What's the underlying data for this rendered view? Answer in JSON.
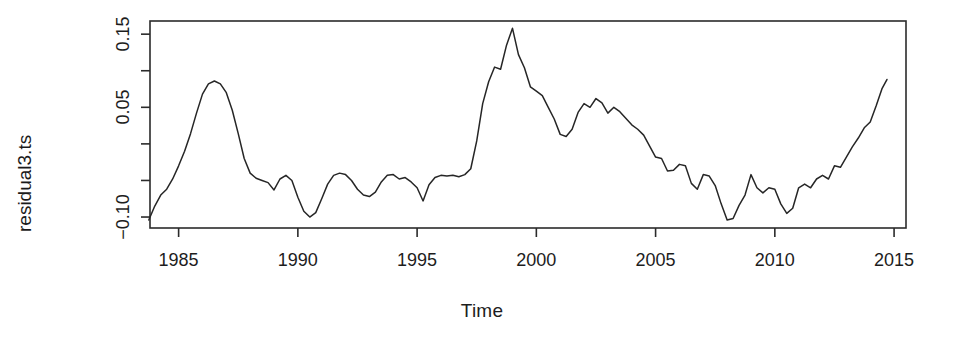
{
  "chart_data": {
    "type": "line",
    "title": "",
    "subtitle": "",
    "xlabel": "Time",
    "ylabel": "residual3.ts",
    "xlim": [
      1983.8,
      2015.5
    ],
    "ylim": [
      -0.115,
      0.168
    ],
    "xticks": [
      1985,
      1990,
      1995,
      2000,
      2005,
      2010,
      2015
    ],
    "xtick_labels": [
      "1985",
      "1990",
      "1995",
      "2000",
      "2005",
      "2010",
      "2015"
    ],
    "yticks": [
      -0.1,
      -0.05,
      0.0,
      0.05,
      0.1,
      0.15
    ],
    "ytick_labels": [
      "-0.10",
      "",
      "",
      "0.05",
      "",
      "0.15"
    ],
    "ytick_labels_shown": [
      {
        "value": 0.15,
        "label": "0.15"
      },
      {
        "value": 0.05,
        "label": "0.05"
      },
      {
        "value": -0.1,
        "label": "-0.10"
      }
    ],
    "grid": false,
    "legend": null,
    "legend_position": "none",
    "line_color": "#262626",
    "background_color": "#ffffff",
    "series": [
      {
        "name": "residual3.ts",
        "x": [
          1983.75,
          1984.0,
          1984.25,
          1984.5,
          1984.75,
          1985.0,
          1985.25,
          1985.5,
          1985.75,
          1986.0,
          1986.25,
          1986.5,
          1986.75,
          1987.0,
          1987.25,
          1987.5,
          1987.75,
          1988.0,
          1988.25,
          1988.5,
          1988.75,
          1989.0,
          1989.25,
          1989.5,
          1989.75,
          1990.0,
          1990.25,
          1990.5,
          1990.75,
          1991.0,
          1991.25,
          1991.5,
          1991.75,
          1992.0,
          1992.25,
          1992.5,
          1992.75,
          1993.0,
          1993.25,
          1993.5,
          1993.75,
          1994.0,
          1994.25,
          1994.5,
          1994.75,
          1995.0,
          1995.25,
          1995.5,
          1995.75,
          1996.0,
          1996.25,
          1996.5,
          1996.75,
          1997.0,
          1997.25,
          1997.5,
          1997.75,
          1998.0,
          1998.25,
          1998.5,
          1998.75,
          1999.0,
          1999.25,
          1999.5,
          1999.75,
          2000.0,
          2000.25,
          2000.5,
          2000.75,
          2001.0,
          2001.25,
          2001.5,
          2001.75,
          2002.0,
          2002.25,
          2002.5,
          2002.75,
          2003.0,
          2003.25,
          2003.5,
          2003.75,
          2004.0,
          2004.25,
          2004.5,
          2004.75,
          2005.0,
          2005.25,
          2005.5,
          2005.75,
          2006.0,
          2006.25,
          2006.5,
          2006.75,
          2007.0,
          2007.25,
          2007.5,
          2007.75,
          2008.0,
          2008.25,
          2008.5,
          2008.75,
          2009.0,
          2009.25,
          2009.5,
          2009.75,
          2010.0,
          2010.25,
          2010.5,
          2010.75,
          2011.0,
          2011.25,
          2011.5,
          2011.75,
          2012.0,
          2012.25,
          2012.5,
          2012.75,
          2013.0,
          2013.25,
          2013.5,
          2013.75,
          2014.0,
          2014.25,
          2014.5,
          2014.7
        ],
        "y": [
          -0.104,
          -0.085,
          -0.07,
          -0.062,
          -0.048,
          -0.03,
          -0.01,
          0.014,
          0.042,
          0.068,
          0.082,
          0.086,
          0.082,
          0.07,
          0.046,
          0.014,
          -0.02,
          -0.04,
          -0.047,
          -0.05,
          -0.053,
          -0.063,
          -0.048,
          -0.043,
          -0.05,
          -0.073,
          -0.092,
          -0.1,
          -0.094,
          -0.075,
          -0.055,
          -0.043,
          -0.04,
          -0.042,
          -0.05,
          -0.062,
          -0.07,
          -0.072,
          -0.066,
          -0.052,
          -0.043,
          -0.042,
          -0.048,
          -0.046,
          -0.052,
          -0.06,
          -0.078,
          -0.056,
          -0.046,
          -0.043,
          -0.044,
          -0.043,
          -0.045,
          -0.042,
          -0.034,
          0.004,
          0.055,
          0.085,
          0.105,
          0.102,
          0.135,
          0.158,
          0.122,
          0.104,
          0.078,
          0.072,
          0.066,
          0.05,
          0.034,
          0.013,
          0.01,
          0.02,
          0.043,
          0.055,
          0.05,
          0.062,
          0.056,
          0.042,
          0.05,
          0.044,
          0.035,
          0.026,
          0.02,
          0.012,
          -0.003,
          -0.018,
          -0.02,
          -0.037,
          -0.036,
          -0.028,
          -0.03,
          -0.054,
          -0.062,
          -0.042,
          -0.044,
          -0.057,
          -0.082,
          -0.104,
          -0.102,
          -0.084,
          -0.07,
          -0.042,
          -0.06,
          -0.067,
          -0.06,
          -0.062,
          -0.082,
          -0.095,
          -0.088,
          -0.06,
          -0.055,
          -0.06,
          -0.048,
          -0.043,
          -0.048,
          -0.03,
          -0.032,
          -0.018,
          -0.004,
          0.008,
          0.022,
          0.03,
          0.052,
          0.076,
          0.088
        ]
      }
    ]
  },
  "plot": {
    "geometry": {
      "left": 150,
      "right": 906,
      "top": 21,
      "bottom": 228
    }
  }
}
